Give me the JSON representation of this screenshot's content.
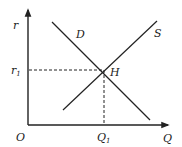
{
  "diagram": {
    "axes": {
      "y_label": "r",
      "x_label": "Q",
      "origin_label": "O"
    },
    "curves": [
      {
        "name": "D",
        "label": "D",
        "from": [
          52,
          22
        ],
        "to": [
          150,
          120
        ]
      },
      {
        "name": "S",
        "label": "S",
        "from": [
          157,
          21
        ],
        "to": [
          63,
          110
        ]
      }
    ],
    "equilibrium": {
      "label": "H",
      "point": [
        104,
        70
      ],
      "r_label": "r",
      "r_sub": "1",
      "q_label": "Q",
      "q_sub": "1"
    },
    "colors": {
      "line": "#222222",
      "background": "#ffffff"
    }
  }
}
